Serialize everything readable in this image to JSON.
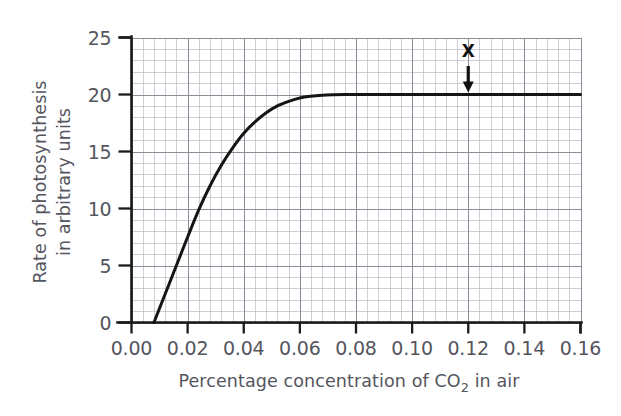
{
  "chart_data": {
    "type": "line",
    "title": "",
    "xlabel": "Percentage concentration of CO2 in air",
    "xlabel_parts": {
      "before": "Percentage concentration of CO",
      "subscript": "2",
      "after": " in air"
    },
    "ylabel": "Rate of photosynthesis in arbitrary units",
    "ylabel_lines": [
      "Rate of photosynthesis",
      "in arbitrary units"
    ],
    "xlim": [
      0.0,
      0.16
    ],
    "ylim": [
      0,
      25
    ],
    "xticks": [
      0.0,
      0.02,
      0.04,
      0.06,
      0.08,
      0.1,
      0.12,
      0.14,
      0.16
    ],
    "xtick_labels": [
      "0.00",
      "0.02",
      "0.04",
      "0.06",
      "0.08",
      "0.10",
      "0.12",
      "0.14",
      "0.16"
    ],
    "yticks": [
      0,
      5,
      10,
      15,
      20,
      25
    ],
    "ytick_labels": [
      "0",
      "5",
      "10",
      "15",
      "20",
      "25"
    ],
    "grid": true,
    "grid_minor_step_x": 0.004,
    "grid_minor_step_y": 1,
    "grid_major_step_x": 0.02,
    "grid_major_step_y": 5,
    "legend": null,
    "series": [
      {
        "name": "Rate of photosynthesis",
        "x": [
          0.008,
          0.012,
          0.016,
          0.02,
          0.024,
          0.028,
          0.032,
          0.036,
          0.04,
          0.044,
          0.048,
          0.052,
          0.056,
          0.06,
          0.064,
          0.068,
          0.072,
          0.076,
          0.08,
          0.09,
          0.1,
          0.11,
          0.12,
          0.13,
          0.14,
          0.15,
          0.16
        ],
        "y": [
          0.0,
          2.5,
          5.0,
          7.5,
          9.9,
          12.0,
          13.8,
          15.3,
          16.6,
          17.6,
          18.4,
          19.0,
          19.4,
          19.7,
          19.85,
          19.93,
          19.97,
          19.99,
          20.0,
          20.0,
          20.0,
          20.0,
          20.0,
          20.0,
          20.0,
          20.0,
          20.0
        ]
      }
    ],
    "annotations": [
      {
        "label": "X",
        "kind": "arrow-marker",
        "x": 0.12,
        "y": 20,
        "description": "Labelled X with downward arrow pointing to the plateau of the curve"
      }
    ]
  },
  "colors": {
    "background": "#ffffff",
    "curve": "#151515",
    "axis": "#1a1a1a",
    "grid_minor": "#b9b9c4",
    "grid_major": "#8d8d99",
    "text": "#55555e",
    "marker": "#111111"
  }
}
